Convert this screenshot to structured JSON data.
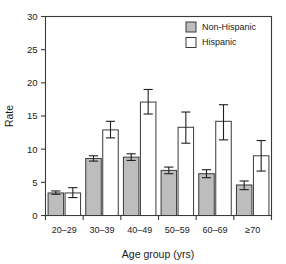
{
  "chart_data": {
    "type": "bar",
    "title": "",
    "xlabel": "Age group (yrs)",
    "ylabel": "Rate",
    "ylim": [
      0,
      30
    ],
    "yticks": [
      0,
      5,
      10,
      15,
      20,
      25,
      30
    ],
    "ytick_labels": [
      "0",
      "5",
      "10",
      "15",
      "20",
      "25",
      "30"
    ],
    "grid": false,
    "legend_position": "top-right",
    "categories": [
      "20–29",
      "30–39",
      "40–49",
      "50–59",
      "60–69",
      "≥70"
    ],
    "series": [
      {
        "name": "Non-Hispanic",
        "color": "#bdbdbd",
        "values": [
          3.4,
          8.6,
          8.8,
          6.8,
          6.3,
          4.6
        ],
        "err_low": [
          3.2,
          8.2,
          8.3,
          6.3,
          5.7,
          3.9
        ],
        "err_high": [
          3.7,
          9.0,
          9.3,
          7.3,
          6.9,
          5.2
        ]
      },
      {
        "name": "Hispanic",
        "color": "#ffffff",
        "values": [
          3.4,
          12.9,
          17.1,
          13.3,
          14.2,
          9.0
        ],
        "err_low": [
          2.7,
          11.7,
          15.3,
          10.9,
          11.4,
          6.7
        ],
        "err_high": [
          4.2,
          14.2,
          19.0,
          15.6,
          16.7,
          11.3
        ]
      }
    ]
  },
  "legend": {
    "items": [
      {
        "label": "Non-Hispanic",
        "swatch": "#bdbdbd"
      },
      {
        "label": "Hispanic",
        "swatch": "#ffffff"
      }
    ]
  },
  "axes": {
    "y_title": "Rate",
    "x_title": "Age group (yrs)"
  }
}
